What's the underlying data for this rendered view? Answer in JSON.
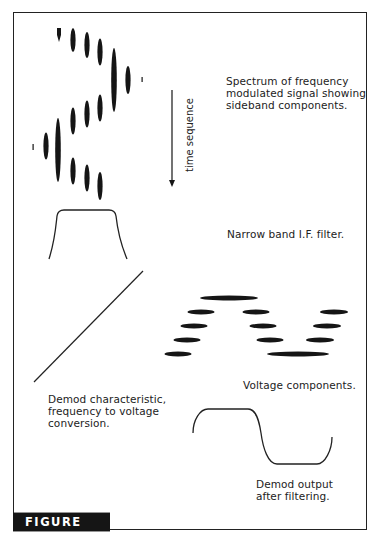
{
  "figure": {
    "label": "FIGURE 7.5",
    "captions": {
      "spectrum": [
        "Spectrum of frequency",
        "modulated signal showing",
        "sideband components."
      ],
      "time_axis": "time sequence",
      "filter": "Narrow band I.F. filter.",
      "voltage": "Voltage components.",
      "demod_char": [
        "Demod characteristic,",
        "frequency to voltage",
        "conversion."
      ],
      "demod_output": [
        "Demod output",
        "after filtering."
      ]
    }
  },
  "colors": {
    "ink": "#151515",
    "background": "#ffffff"
  }
}
